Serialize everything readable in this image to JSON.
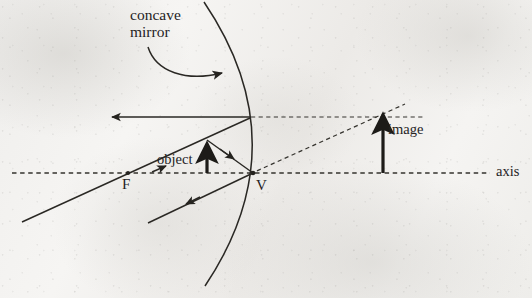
{
  "figure": {
    "background_color": "#f2f1ef",
    "ink_color": "#25231f"
  },
  "labels": {
    "concave_mirror_line1": "concave",
    "concave_mirror_line2": "mirror",
    "object": "object",
    "image": "image",
    "axis": "axis",
    "focal_point": "F",
    "vertex": "V"
  },
  "geometry": {
    "axis": {
      "y": 173,
      "x_start": 12,
      "x_end": 490,
      "style": "dashed"
    },
    "focal_point": {
      "x": 128,
      "y": 173
    },
    "vertex": {
      "x": 253,
      "y": 173
    },
    "mirror_arc": {
      "type": "concave",
      "top": {
        "x": 204,
        "y": 2
      },
      "vertex": {
        "x": 253,
        "y": 173
      },
      "bottom": {
        "x": 205,
        "y": 286
      }
    },
    "object_arrow": {
      "x": 207,
      "y_base": 173,
      "y_tip": 139
    },
    "image_arrow": {
      "x": 383,
      "y_base": 173,
      "y_tip": 110
    },
    "rays": [
      {
        "name": "incident-through-focus",
        "from": {
          "x": 22,
          "y": 222
        },
        "to": {
          "x": 250,
          "y": 118
        },
        "style": "solid",
        "arrow_mid": true
      },
      {
        "name": "reflected-parallel-to-axis",
        "from": {
          "x": 250,
          "y": 117
        },
        "to": {
          "x": 108,
          "y": 117
        },
        "style": "solid",
        "arrow_end": true
      },
      {
        "name": "incident-to-vertex",
        "from": {
          "x": 207,
          "y": 140
        },
        "to": {
          "x": 253,
          "y": 173
        },
        "style": "solid",
        "arrow_mid": true
      },
      {
        "name": "reflected-from-vertex",
        "from": {
          "x": 253,
          "y": 173
        },
        "to": {
          "x": 148,
          "y": 223
        },
        "style": "solid",
        "arrow_mid": true
      }
    ],
    "virtual_extensions": [
      {
        "name": "horizontal-virtual-ray",
        "from": {
          "x": 253,
          "y": 117
        },
        "to": {
          "x": 423,
          "y": 117
        },
        "style": "dashed"
      },
      {
        "name": "diagonal-virtual-ray",
        "from": {
          "x": 250,
          "y": 174
        },
        "to": {
          "x": 405,
          "y": 104
        },
        "style": "dashed"
      }
    ],
    "pointer_arrow": {
      "name": "concave-mirror-pointer",
      "from": {
        "x": 148,
        "y": 47
      },
      "to": {
        "x": 225,
        "y": 74
      },
      "style": "curved"
    }
  }
}
